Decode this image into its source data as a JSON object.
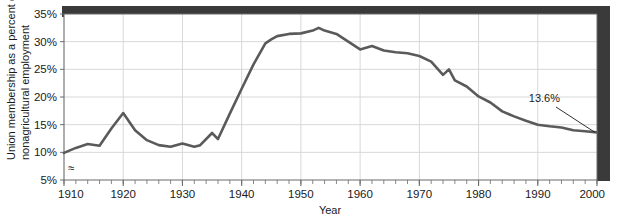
{
  "chart_data": {
    "type": "line",
    "title": "",
    "xlabel": "Year",
    "ylabel": "Union membership as a percent of nonagricultural employment",
    "ylabel_line1": "Union membership as a percent of",
    "ylabel_line2": "nonagricultural employment",
    "xlim": [
      1910,
      2000
    ],
    "ylim": [
      5,
      35
    ],
    "y_axis_break": true,
    "y_axis_break_symbol": "≈",
    "grid": true,
    "legend": null,
    "line_color": "#5a5a5a",
    "gridline_color": "#d8d8d8",
    "axis_color": "#6b6b6b",
    "shadow_color": "#3a3a3a",
    "xticks": [
      1910,
      1920,
      1930,
      1940,
      1950,
      1960,
      1970,
      1980,
      1990,
      2000
    ],
    "xtick_labels": [
      "1910",
      "1920",
      "1930",
      "1940",
      "1950",
      "1960",
      "1970",
      "1980",
      "1990",
      "2000"
    ],
    "x_minor_tick_interval": 2,
    "yticks": [
      5,
      10,
      15,
      20,
      25,
      30,
      35
    ],
    "ytick_labels": [
      "5%",
      "10%",
      "15%",
      "20%",
      "25%",
      "30%",
      "35%"
    ],
    "annotations": [
      {
        "text": "13.6%",
        "value": 13.6,
        "year": 2000,
        "label_x": 560,
        "label_y": 102,
        "leader_from_x": 556,
        "leader_from_y": 107,
        "leader_to_x": 584,
        "leader_to_y": 148
      }
    ],
    "x": [
      1910,
      1912,
      1914,
      1916,
      1918,
      1920,
      1922,
      1924,
      1926,
      1928,
      1930,
      1932,
      1933,
      1935,
      1936,
      1938,
      1940,
      1942,
      1944,
      1945,
      1946,
      1948,
      1950,
      1952,
      1953,
      1954,
      1956,
      1958,
      1960,
      1962,
      1964,
      1966,
      1968,
      1970,
      1972,
      1974,
      1975,
      1976,
      1978,
      1980,
      1982,
      1984,
      1986,
      1988,
      1990,
      1992,
      1994,
      1996,
      1998,
      2000
    ],
    "y": [
      9.9,
      10.8,
      11.5,
      11.2,
      14.3,
      17.1,
      14.0,
      12.2,
      11.3,
      11.0,
      11.6,
      11.0,
      11.3,
      13.5,
      12.4,
      17.0,
      21.5,
      25.9,
      29.7,
      30.4,
      31.0,
      31.4,
      31.5,
      32.0,
      32.5,
      32.0,
      31.4,
      30.0,
      28.6,
      29.2,
      28.4,
      28.1,
      27.9,
      27.4,
      26.4,
      24.0,
      25.0,
      23.0,
      21.9,
      20.1,
      19.0,
      17.4,
      16.5,
      15.7,
      15.0,
      14.7,
      14.5,
      14.0,
      13.8,
      13.6
    ]
  }
}
